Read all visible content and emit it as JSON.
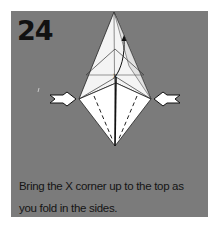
{
  "step": {
    "number": "24",
    "instruction": "Bring the X corner up to the top as you fold in the sides."
  },
  "diagram": {
    "marker_label": "X",
    "arrows": [
      "left-push-arrow",
      "right-push-arrow",
      "up-curved-arrow"
    ]
  },
  "colors": {
    "panel": "#7b7b7b",
    "paper": "#ffffff",
    "text": "#141414"
  }
}
